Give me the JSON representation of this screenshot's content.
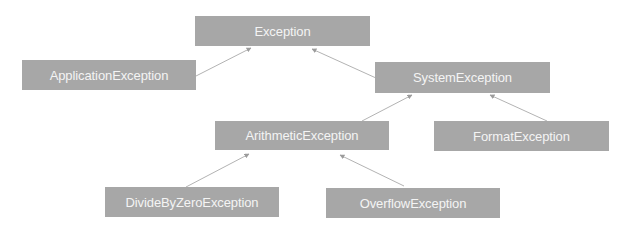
{
  "diagram": {
    "type": "class-hierarchy",
    "box_color": "#a7a7a7",
    "text_color": "#f4f4f4",
    "edge_color": "#b3b3b3",
    "nodes": {
      "exception": {
        "label": "Exception",
        "x": 195,
        "y": 16,
        "w": 175,
        "h": 30
      },
      "application_exception": {
        "label": "ApplicationException",
        "x": 22,
        "y": 60,
        "w": 174,
        "h": 30
      },
      "system_exception": {
        "label": "SystemException",
        "x": 375,
        "y": 62,
        "w": 175,
        "h": 31
      },
      "arithmetic_exception": {
        "label": "ArithmeticException",
        "x": 215,
        "y": 121,
        "w": 174,
        "h": 29
      },
      "format_exception": {
        "label": "FormatException",
        "x": 434,
        "y": 121,
        "w": 175,
        "h": 30
      },
      "divide_by_zero_exception": {
        "label": "DivideByZeroException",
        "x": 105,
        "y": 187,
        "w": 174,
        "h": 30
      },
      "overflow_exception": {
        "label": "OverflowException",
        "x": 326,
        "y": 188,
        "w": 174,
        "h": 30
      }
    },
    "edges": [
      {
        "from": "ApplicationException",
        "to": "Exception"
      },
      {
        "from": "SystemException",
        "to": "Exception"
      },
      {
        "from": "ArithmeticException",
        "to": "SystemException"
      },
      {
        "from": "FormatException",
        "to": "SystemException"
      },
      {
        "from": "DivideByZeroException",
        "to": "ArithmeticException"
      },
      {
        "from": "OverflowException",
        "to": "ArithmeticException"
      }
    ]
  }
}
